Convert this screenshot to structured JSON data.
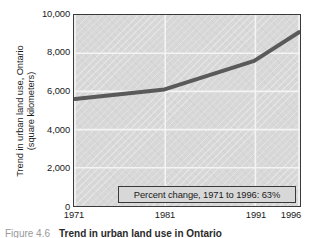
{
  "chart_data": {
    "type": "line",
    "title": "",
    "xlabel": "",
    "ylabel": "Trend in urban land use, Ontario (square kilometers)",
    "ylabel_lines": [
      "Trend in urban land use, Ontario",
      "(square kilometers)"
    ],
    "x": [
      1971,
      1981,
      1991,
      1996
    ],
    "values": [
      5600,
      6100,
      7600,
      9100
    ],
    "series": [
      {
        "name": "Urban land use, Ontario",
        "values": [
          5600,
          6100,
          7600,
          9100
        ],
        "color": "#5a5a5a"
      }
    ],
    "xtick_labels": [
      "1971",
      "1981",
      "1991",
      "1996"
    ],
    "xtick_values": [
      1971,
      1981,
      1991,
      1996
    ],
    "ytick_labels": [
      "10,000",
      "8,000",
      "6,000",
      "4,000",
      "2,000",
      "0"
    ],
    "ytick_values": [
      10000,
      8000,
      6000,
      4000,
      2000,
      0
    ],
    "ylim": [
      0,
      10000
    ],
    "xlim": [
      1971,
      1996
    ],
    "grid": true,
    "grid_color": "#f2f2f2",
    "legend": "none",
    "plot_background": "#d8d8d8",
    "annotations": [
      {
        "text": "Percent change, 1971 to 1996: 63%",
        "x": 1989,
        "y": 900
      }
    ]
  },
  "annotation": {
    "text": "Percent change, 1971 to 1996: 63%"
  },
  "caption": {
    "label": "Figure 4.6",
    "title": "Trend in urban land use in Ontario"
  }
}
